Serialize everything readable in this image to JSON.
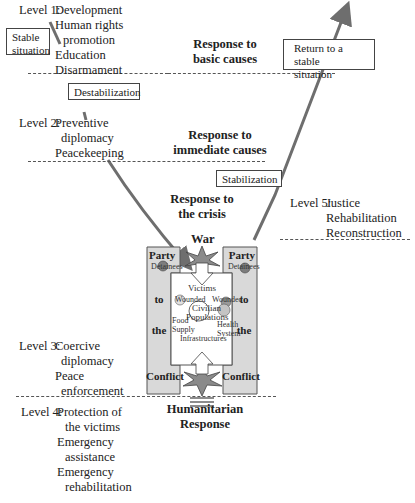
{
  "levels": {
    "level1": {
      "label": "Level 1:",
      "items": [
        "Development",
        "Human rights",
        "promotion",
        "Education",
        "Disarmament"
      ]
    },
    "level2": {
      "label": "Level 2:",
      "items": [
        "Preventive",
        "diplomacy",
        "Peacekeeping"
      ]
    },
    "level3": {
      "label": "Level 3:",
      "items": [
        "Coercive",
        "diplomacy",
        "Peace",
        "enforcement"
      ]
    },
    "level4": {
      "label": "Level 4:",
      "items": [
        "Protection of",
        "the victims",
        "Emergency",
        "assistance",
        "Emergency",
        "rehabilitation"
      ]
    },
    "level5": {
      "label": "Level 5:",
      "items": [
        "Justice",
        "Rehabilitation",
        "Reconstruction"
      ]
    }
  },
  "responses": {
    "basic": [
      "Response to",
      "basic causes"
    ],
    "immediate": [
      "Response to",
      "immediate causes"
    ],
    "crisis": [
      "Response to",
      "the crisis"
    ],
    "humanitarian": [
      "Humanitarian",
      "Response"
    ]
  },
  "phase_boxes": {
    "stable": [
      "Stable",
      "situation"
    ],
    "destabilization": "Destabilization",
    "stabilization": "Stabilization",
    "return": [
      "Return to a stable",
      "situation"
    ]
  },
  "conflict_diagram": {
    "war_label": "War",
    "left_column": [
      "Party",
      "to",
      "the",
      "Conflict"
    ],
    "right_column": [
      "Party",
      "to",
      "the",
      "Conflict"
    ],
    "detainees": "Detainees",
    "center": {
      "victims": "Victims",
      "wounded": "Wounded",
      "civilian": "Civilian",
      "populations": "Populations",
      "food_supply": [
        "Food",
        "Supply"
      ],
      "health_system": [
        "Health",
        "System"
      ],
      "infrastructures": "Infrastructures"
    }
  },
  "colors": {
    "arrow": "#6e6e6e",
    "frame_fill": "#d9d9d9",
    "star_fill": "#8a8a8a",
    "circle_fill": "#7d7d7d"
  }
}
